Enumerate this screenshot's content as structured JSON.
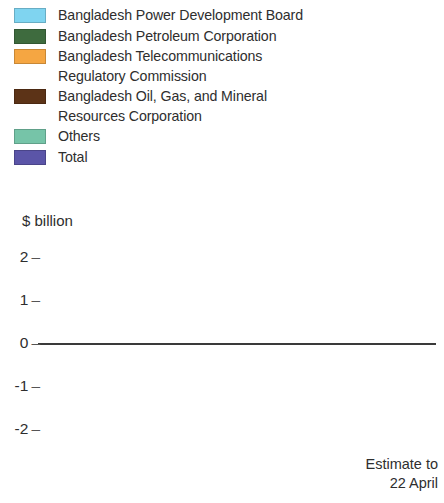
{
  "ylabel": "$ billion",
  "legend": {
    "items": [
      {
        "label": "Bangladesh Power Development Board",
        "color": "#7FD4F0",
        "key": "power"
      },
      {
        "label": "Bangladesh Petroleum Corporation",
        "color": "#3E6B3E",
        "key": "petroleum"
      },
      {
        "label": "Bangladesh Telecommunications\nRegulatory Commission",
        "color": "#F5A642",
        "key": "telecom"
      },
      {
        "label": "Bangladesh Oil, Gas, and Mineral\nResources Corporation",
        "color": "#5C3317",
        "key": "oilgas"
      },
      {
        "label": "Others",
        "color": "#76C4A8",
        "key": "others"
      },
      {
        "label": "Total",
        "color": "#5B55A8",
        "key": "total"
      }
    ]
  },
  "footnote": "Estimate to\n22 April",
  "chart_data": {
    "type": "bar",
    "title": "",
    "xlabel": "",
    "ylabel": "$ billion",
    "ylim": [
      -2,
      2
    ],
    "yticks": [
      2,
      1,
      0,
      -1,
      -2
    ],
    "ytick_labels": [
      "2",
      "1",
      "0",
      "-1",
      "-2"
    ],
    "grid": "vertical-dotted-between-groups",
    "legend_position": "top",
    "categories": [
      "2011",
      "2012",
      "2013",
      "2014",
      "2015"
    ],
    "series": [
      {
        "name": "Bangladesh Power Development Board",
        "color": "#7FD4F0",
        "values": [
          -0.8,
          -0.95,
          -0.78,
          -1.08,
          -1.28
        ]
      },
      {
        "name": "Bangladesh Petroleum Corporation",
        "color": "#3E6B3E",
        "values": [
          -1.37,
          -1.6,
          -0.72,
          -0.33,
          0.4
        ]
      },
      {
        "name": "Bangladesh Telecommunications Regulatory Commission",
        "color": "#F5A642",
        "values": [
          0.35,
          0.8,
          0.6,
          1.18,
          0.8
        ]
      },
      {
        "name": "Bangladesh Oil, Gas, and Mineral Resources Corporation",
        "color": "#5C3317",
        "values": [
          0.1,
          0.02,
          0.07,
          0.04,
          0.06
        ]
      },
      {
        "name": "Others",
        "color": "#76C4A8",
        "values": [
          0.06,
          0.12,
          0.09,
          0.17,
          0.04
        ]
      },
      {
        "name": "Total",
        "color": "#5B55A8",
        "values": [
          -1.28,
          -1.3,
          -0.36,
          0.29,
          0.31
        ]
      }
    ]
  }
}
